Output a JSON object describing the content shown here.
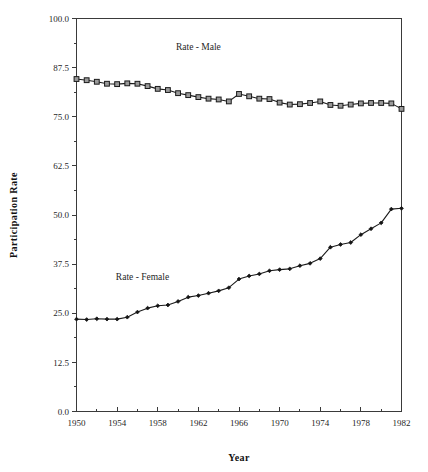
{
  "chart_data": {
    "type": "line",
    "title": "",
    "xlabel": "Year",
    "ylabel": "Participation Rate",
    "xlim": [
      1950,
      1982
    ],
    "ylim": [
      0.0,
      100.0
    ],
    "grid": false,
    "legend_position": "inline-annotation",
    "x_major_ticks": [
      1950,
      1954,
      1958,
      1962,
      1966,
      1970,
      1974,
      1978,
      1982
    ],
    "x_major_tick_labels": [
      "1950",
      "1954",
      "1958",
      "1962",
      "1966",
      "1970",
      "1974",
      "1978",
      "1982"
    ],
    "x_minor_ticks": [
      1952,
      1956,
      1960,
      1964,
      1968,
      1972,
      1976,
      1980
    ],
    "y_major_ticks": [
      0.0,
      12.5,
      25.0,
      37.5,
      50.0,
      62.5,
      75.0,
      87.5,
      100.0
    ],
    "y_major_tick_labels": [
      "0.0",
      "12.5",
      "25.0",
      "37.5",
      "50.0",
      "62.5",
      "75.0",
      "87.5",
      "100.0"
    ],
    "y_minor_ticks": [
      6.25,
      18.75,
      31.25,
      43.75,
      56.25,
      68.75,
      81.25,
      93.75
    ],
    "x": [
      1950,
      1951,
      1952,
      1953,
      1954,
      1955,
      1956,
      1957,
      1958,
      1959,
      1960,
      1961,
      1962,
      1963,
      1964,
      1965,
      1966,
      1967,
      1968,
      1969,
      1970,
      1971,
      1972,
      1973,
      1974,
      1975,
      1976,
      1977,
      1978,
      1979,
      1980,
      1981,
      1982
    ],
    "series": [
      {
        "name": "Rate - Male",
        "marker": "square",
        "annotation": "Rate - Male",
        "annotation_x": 1962.0,
        "annotation_y": 92.0,
        "values": [
          84.6,
          84.3,
          83.9,
          83.4,
          83.3,
          83.5,
          83.4,
          82.8,
          82.1,
          81.8,
          81.0,
          80.5,
          80.0,
          79.6,
          79.4,
          78.9,
          80.8,
          80.2,
          79.6,
          79.5,
          78.6,
          78.1,
          78.2,
          78.5,
          78.9,
          78.0,
          77.8,
          78.1,
          78.4,
          78.5,
          78.5,
          78.4,
          77.0
        ]
      },
      {
        "name": "Rate - Female",
        "marker": "diamond",
        "annotation": "Rate - Female",
        "annotation_x": 1956.5,
        "annotation_y": 33.5,
        "values": [
          23.5,
          23.4,
          23.6,
          23.5,
          23.5,
          24.0,
          25.3,
          26.3,
          26.9,
          27.1,
          28.0,
          29.1,
          29.5,
          30.1,
          30.7,
          31.5,
          33.7,
          34.5,
          35.0,
          35.8,
          36.1,
          36.3,
          37.1,
          37.7,
          38.9,
          41.8,
          42.5,
          43.0,
          45.0,
          46.5,
          48.0,
          51.5,
          51.7
        ]
      }
    ]
  },
  "axes": {
    "x_title": "Year",
    "y_title": "Participation Rate"
  }
}
